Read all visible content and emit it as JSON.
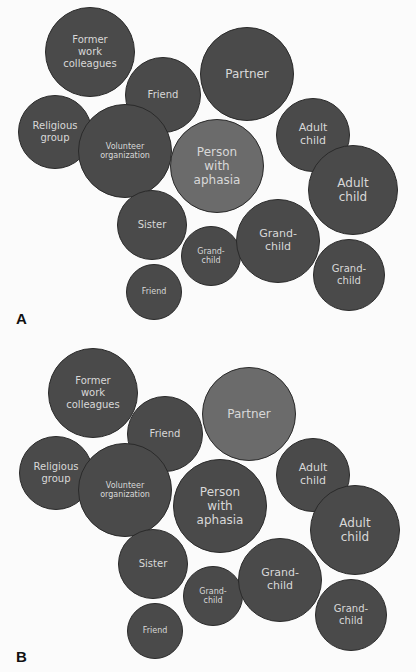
{
  "colors": {
    "background": "#fbfbfb",
    "dark_bubble": "#4a4a4a",
    "light_bubble": "#6b6b6b",
    "text": "#d8d8d8"
  },
  "panels": [
    {
      "label": "A",
      "highlight": "Person with aphasia",
      "bubbles": [
        {
          "text": "Former\nwork\ncolleagues",
          "cx": 90,
          "cy": 52,
          "r": 45,
          "fs": 10
        },
        {
          "text": "Friend",
          "cx": 163,
          "cy": 95,
          "r": 38,
          "fs": 10
        },
        {
          "text": "Partner",
          "cx": 247,
          "cy": 74,
          "r": 47,
          "fs": 12
        },
        {
          "text": "Religious\ngroup",
          "cx": 55,
          "cy": 132,
          "r": 37,
          "fs": 10
        },
        {
          "text": "Volunteer\norganization",
          "cx": 125,
          "cy": 151,
          "r": 47,
          "fs": 8
        },
        {
          "text": "Person\nwith\naphasia",
          "cx": 217,
          "cy": 166,
          "r": 47,
          "fs": 12,
          "light": true
        },
        {
          "text": "Adult\nchild",
          "cx": 313,
          "cy": 135,
          "r": 37,
          "fs": 11
        },
        {
          "text": "Adult\nchild",
          "cx": 353,
          "cy": 190,
          "r": 45,
          "fs": 12
        },
        {
          "text": "Sister",
          "cx": 152,
          "cy": 225,
          "r": 35,
          "fs": 10
        },
        {
          "text": "Grand-\nchild",
          "cx": 211,
          "cy": 256,
          "r": 30,
          "fs": 8
        },
        {
          "text": "Grand-\nchild",
          "cx": 278,
          "cy": 241,
          "r": 42,
          "fs": 11
        },
        {
          "text": "Grand-\nchild",
          "cx": 349,
          "cy": 275,
          "r": 36,
          "fs": 10
        },
        {
          "text": "Friend",
          "cx": 154,
          "cy": 292,
          "r": 28,
          "fs": 8
        }
      ]
    },
    {
      "label": "B",
      "highlight": "Partner",
      "bubbles": [
        {
          "text": "Former\nwork\ncolleagues",
          "cx": 93,
          "cy": 393,
          "r": 45,
          "fs": 10
        },
        {
          "text": "Friend",
          "cx": 165,
          "cy": 434,
          "r": 38,
          "fs": 10
        },
        {
          "text": "Partner",
          "cx": 249,
          "cy": 414,
          "r": 47,
          "fs": 12,
          "light": true
        },
        {
          "text": "Religious\ngroup",
          "cx": 56,
          "cy": 473,
          "r": 37,
          "fs": 10
        },
        {
          "text": "Volunteer\norganization",
          "cx": 125,
          "cy": 490,
          "r": 47,
          "fs": 8
        },
        {
          "text": "Person\nwith\naphasia",
          "cx": 220,
          "cy": 506,
          "r": 47,
          "fs": 12
        },
        {
          "text": "Adult\nchild",
          "cx": 313,
          "cy": 475,
          "r": 37,
          "fs": 11
        },
        {
          "text": "Adult\nchild",
          "cx": 355,
          "cy": 530,
          "r": 45,
          "fs": 12
        },
        {
          "text": "Sister",
          "cx": 153,
          "cy": 564,
          "r": 35,
          "fs": 10
        },
        {
          "text": "Grand-\nchild",
          "cx": 213,
          "cy": 596,
          "r": 30,
          "fs": 8
        },
        {
          "text": "Grand-\nchild",
          "cx": 280,
          "cy": 580,
          "r": 42,
          "fs": 11
        },
        {
          "text": "Grand-\nchild",
          "cx": 351,
          "cy": 615,
          "r": 36,
          "fs": 10
        },
        {
          "text": "Friend",
          "cx": 155,
          "cy": 631,
          "r": 28,
          "fs": 8
        }
      ]
    }
  ],
  "labels": {
    "a": "A",
    "b": "B"
  }
}
